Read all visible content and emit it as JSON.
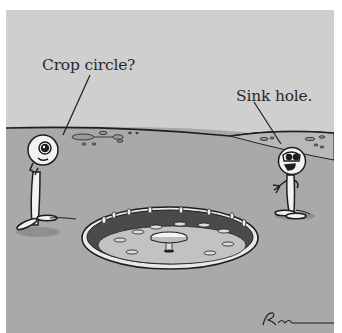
{
  "cartoon": {
    "captions": {
      "left_speaker": "Crop circle?",
      "right_speaker": "Sink hole."
    },
    "signature": "Rogan",
    "colors": {
      "sky": "#cfcfcf",
      "ground": "#a9a9a9",
      "ink": "#1e1e1e",
      "figure_fill": "#f2f2f2"
    },
    "objects": [
      "horizon-line",
      "left-figure",
      "right-figure",
      "drain-strainer",
      "distant-crop-marks",
      "signature"
    ]
  }
}
